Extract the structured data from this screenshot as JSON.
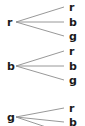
{
  "diagram": {
    "type": "fan-mapping-diagram",
    "width": 85,
    "height": 126,
    "background_color": "#ffffff",
    "edge_color": "#8c8c8c",
    "label_color": "#1a1a1a",
    "source_x": 7,
    "target_x": 69,
    "fan_origin_x": 16,
    "fan_end_x": 64,
    "groups": [
      {
        "id": "group-r",
        "source": {
          "label": "r",
          "y": 22
        },
        "targets": [
          {
            "label": "r",
            "y": 7
          },
          {
            "label": "b",
            "y": 22
          },
          {
            "label": "g",
            "y": 36
          }
        ]
      },
      {
        "id": "group-b",
        "source": {
          "label": "b",
          "y": 66
        },
        "targets": [
          {
            "label": "r",
            "y": 51
          },
          {
            "label": "b",
            "y": 66
          },
          {
            "label": "g",
            "y": 80
          }
        ]
      },
      {
        "id": "group-g",
        "source": {
          "label": "g",
          "y": 117
        },
        "targets": [
          {
            "label": "r",
            "y": 108
          },
          {
            "label": "b",
            "y": 122
          },
          {
            "label": "",
            "y": 133
          }
        ]
      }
    ]
  }
}
